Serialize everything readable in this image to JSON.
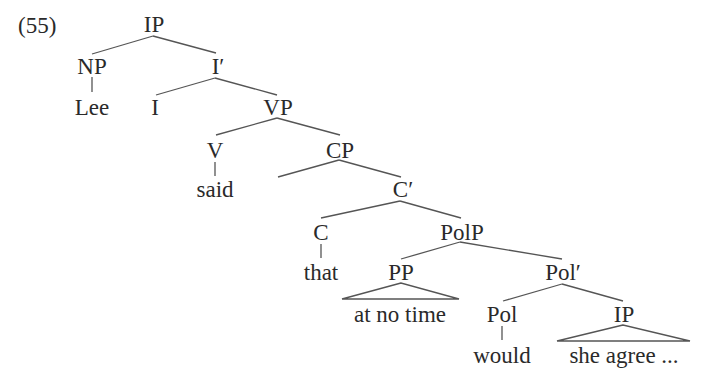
{
  "example_number": "(55)",
  "tree": {
    "nodes": {
      "ip_root": "IP",
      "np": "NP",
      "lee": "Lee",
      "i_bar": "I′",
      "i": "I",
      "vp": "VP",
      "v": "V",
      "said": "said",
      "cp": "CP",
      "c_bar": "C′",
      "c": "C",
      "that": "that",
      "polp": "PolP",
      "pp": "PP",
      "at_no_time": "at no time",
      "pol_bar": "Pol′",
      "pol": "Pol",
      "would": "would",
      "ip_embedded": "IP",
      "she_agree": "she agree ..."
    },
    "structure": "[IP [NP Lee] [I′ [I] [VP [V said] [CP [] [C′ [C that] [PolP [PP at no time] [Pol′ [Pol would] [IP she agree ...]]]]]]]]"
  },
  "colors": {
    "text": "#2a2a2a",
    "lines": "#555555",
    "background": "#ffffff"
  }
}
